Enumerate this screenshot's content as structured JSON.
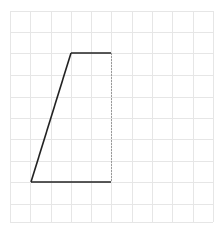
{
  "diagram": {
    "type": "trapezoid-on-grid",
    "colors": {
      "background": "#ffffff",
      "grid": "#e6e6e6",
      "shape_stroke": "#222222",
      "dashed_edge": "#9a9a9a"
    },
    "grid": {
      "columns": 10,
      "rows": 10,
      "x_lines": [
        10,
        30,
        51,
        71,
        91,
        111,
        132,
        152,
        172,
        193,
        213
      ],
      "y_lines": [
        11,
        32,
        53,
        75,
        97,
        118,
        139,
        161,
        182,
        204,
        222
      ]
    },
    "shape": {
      "solid_edges": [
        {
          "name": "top-edge",
          "x1": 71,
          "y1": 53,
          "x2": 111,
          "y2": 53
        },
        {
          "name": "slanted-left-edge",
          "x1": 71,
          "y1": 53,
          "x2": 31,
          "y2": 182
        },
        {
          "name": "bottom-edge",
          "x1": 31,
          "y1": 182,
          "x2": 111,
          "y2": 182
        }
      ],
      "dashed_edges": [
        {
          "name": "right-dashed-edge",
          "x1": 111,
          "y1": 53,
          "x2": 111,
          "y2": 182
        }
      ]
    }
  }
}
